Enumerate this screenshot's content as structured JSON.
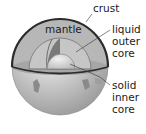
{
  "labels": {
    "crust": "crust",
    "mantle": "mantle",
    "outer_core": [
      "liquid",
      "outer",
      "core"
    ],
    "inner_core": [
      "solid",
      "inner",
      "core"
    ]
  },
  "colors": {
    "crust": "#2b2b2b",
    "mantle": "#a8a8a8",
    "outer_core": "#c4c4c4",
    "inner_core": "#dcdcdc",
    "surface": "#e6e6e6"
  }
}
